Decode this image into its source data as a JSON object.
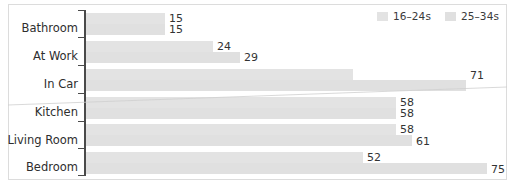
{
  "chart_data": {
    "type": "bar",
    "orientation": "horizontal",
    "title": "",
    "xlabel": "",
    "ylabel": "",
    "grid": false,
    "legend_position": "top-right",
    "xlim": [
      0,
      78
    ],
    "categories": [
      "Bathroom",
      "At Work",
      "In Car",
      "Kitchen",
      "Living Room",
      "Bedroom"
    ],
    "series": [
      {
        "name": "16–24s",
        "color": "#e3e3e3",
        "values": [
          15,
          24,
          50,
          58,
          58,
          52
        ]
      },
      {
        "name": "25–34s",
        "color": "#e0e0e0",
        "values": [
          15,
          29,
          71,
          58,
          61,
          75
        ]
      }
    ]
  },
  "legend": {
    "items": [
      {
        "label": "16–24s",
        "swatch": "#e3e3e3"
      },
      {
        "label": "25–34s",
        "swatch": "#e0e0e0"
      }
    ]
  },
  "axis": {
    "category_labels": [
      "Bathroom",
      "At Work",
      "In Car",
      "Kitchen",
      "Living Room",
      "Bedroom"
    ]
  },
  "values": {
    "bathroom": [
      "15",
      "15"
    ],
    "at_work": [
      "24",
      "29"
    ],
    "in_car": [
      "50",
      "71"
    ],
    "kitchen": [
      "58",
      "58"
    ],
    "living_room": [
      "58",
      "61"
    ],
    "bedroom": [
      "52",
      "75"
    ]
  }
}
